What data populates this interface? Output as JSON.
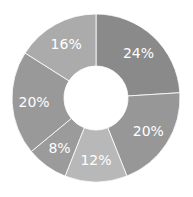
{
  "chart_data": {
    "type": "pie",
    "subtype": "donut",
    "title": "",
    "categories": [
      "A",
      "B",
      "C",
      "D",
      "E",
      "F"
    ],
    "values": [
      24,
      20,
      12,
      8,
      20,
      16
    ],
    "labels": [
      "24%",
      "20%",
      "12%",
      "8%",
      "20%",
      "16%"
    ],
    "colors": [
      "#8a8a8a",
      "#979797",
      "#b8b8b8",
      "#9b9b9b",
      "#999999",
      "#ababab"
    ],
    "start_angle_deg": 0,
    "direction": "clockwise",
    "legend": "none"
  },
  "geometry": {
    "cx": 96,
    "cy": 98,
    "r_outer": 84,
    "r_inner": 32,
    "label_r": 62
  }
}
